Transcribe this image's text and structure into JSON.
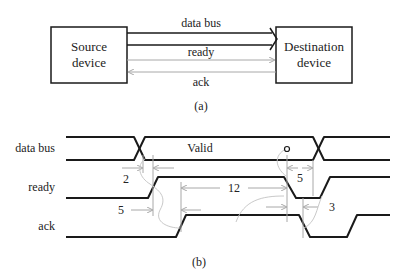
{
  "block_diagram": {
    "source_box": "Source device",
    "source_line1": "Source",
    "source_line2": "device",
    "dest_line1": "Destination",
    "dest_line2": "device",
    "signals": {
      "data_bus": "data bus",
      "ready": "ready",
      "ack": "ack"
    },
    "caption": "(a)"
  },
  "timing_diagram": {
    "rows": {
      "data_bus": "data bus",
      "ready": "ready",
      "ack": "ack"
    },
    "valid_label": "Valid",
    "intervals": {
      "t1": "2",
      "t2": "5",
      "t3": "12",
      "t4": "5",
      "t5": "3"
    },
    "caption": "(b)"
  },
  "colors": {
    "signal": "#1a1a1a",
    "dimension": "#a8a8a8",
    "causality_curve": "#c9c9c9"
  }
}
